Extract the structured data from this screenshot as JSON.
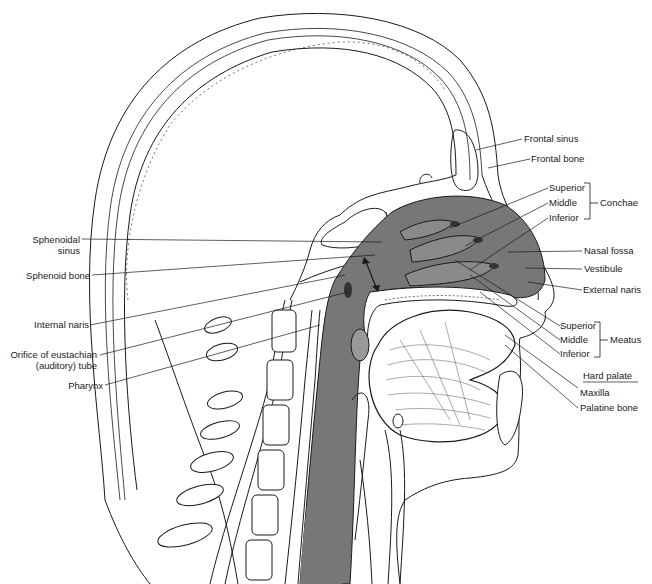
{
  "figure": {
    "fill_color": "#777777",
    "line_color": "#1a1a1a"
  },
  "labels": {
    "right": {
      "frontal_sinus": "Frontal sinus",
      "frontal_bone": "Frontal bone",
      "conchae_superior": "Superior",
      "conchae_middle": "Middle",
      "conchae_inferior": "Inferior",
      "conchae_group": "Conchae",
      "nasal_fossa": "Nasal fossa",
      "vestibule": "Vestibule",
      "external_naris": "External naris",
      "meatus_superior": "Superior",
      "meatus_middle": "Middle",
      "meatus_inferior": "Inferior",
      "meatus_group": "Meatus",
      "hard_palate": "Hard palate",
      "maxilla": "Maxilla",
      "palatine_bone": "Palatine bone"
    },
    "left": {
      "sphenoidal_sinus_line1": "Sphenoidal",
      "sphenoidal_sinus_line2": "sinus",
      "sphenoid_bone": "Sphenoid bone",
      "internal_naris": "Internal naris",
      "eustachian_line1": "Orifice of eustachian",
      "eustachian_line2": "(auditory) tube",
      "pharynx": "Pharynx"
    }
  }
}
